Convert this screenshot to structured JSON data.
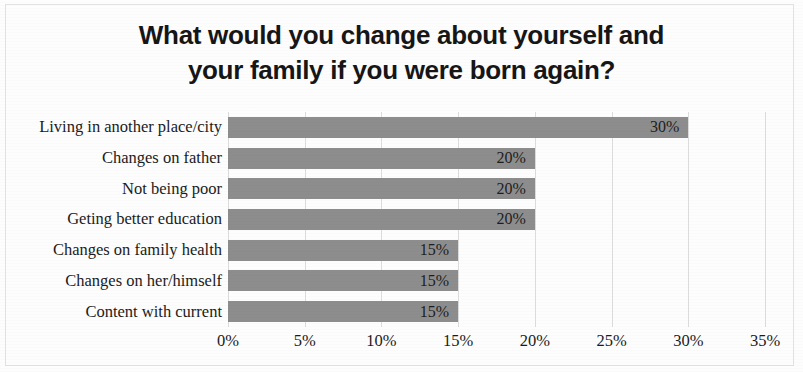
{
  "chart_data": {
    "type": "bar",
    "orientation": "horizontal",
    "title": "What would you change about yourself and\nyour family if you were born again?",
    "title_line_1": "What would you change about yourself and",
    "title_line_2": "your family if you were born again?",
    "xlabel": "",
    "ylabel": "",
    "categories": [
      "Living in another place/city",
      "Changes on father",
      "Not being poor",
      "Geting better education",
      "Changes on family health",
      "Changes on her/himself",
      "Content with current"
    ],
    "values": [
      30,
      20,
      20,
      20,
      15,
      15,
      15
    ],
    "data_labels": [
      "30%",
      "20%",
      "20%",
      "20%",
      "15%",
      "15%",
      "15%"
    ],
    "xlim": [
      0,
      35
    ],
    "xticks": [
      0,
      5,
      10,
      15,
      20,
      25,
      30,
      35
    ],
    "xtick_labels": [
      "0%",
      "5%",
      "10%",
      "15%",
      "20%",
      "25%",
      "30%",
      "35%"
    ],
    "grid": "vertical",
    "legend": "none",
    "bar_color": "#8d8d8d",
    "text_color": "#1b1b1b",
    "gridline_color": "#dcdcdc",
    "background_color": "#fdfdfd"
  }
}
